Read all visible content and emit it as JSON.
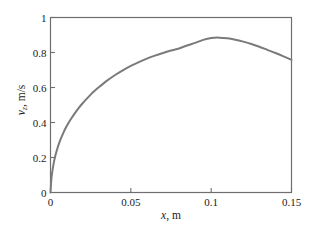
{
  "figure": {
    "background_color": "#ffffff",
    "axis_color": "#6e6e6e",
    "curve_color": "#7a7a7a",
    "text_color": "#1a1a1a"
  },
  "axis_titles": {
    "x_symbol": "x",
    "x_unit": ", m",
    "y_symbol": "v",
    "y_subscript": "z",
    "y_unit": ", m/s"
  },
  "chart_data": {
    "type": "line",
    "title": "",
    "xlabel": "x, m",
    "ylabel": "v_z, m/s",
    "xlim": [
      0,
      0.15
    ],
    "ylim": [
      0,
      1
    ],
    "xticks": [
      0,
      0.05,
      0.1,
      0.15
    ],
    "xtick_labels": [
      "0",
      "0.05",
      "0.1",
      "0.15"
    ],
    "yticks": [
      0,
      0.2,
      0.4,
      0.6,
      0.8,
      1
    ],
    "ytick_labels": [
      "0",
      "0.2",
      "0.4",
      "0.6",
      "0.8",
      "1"
    ],
    "grid": false,
    "legend": null,
    "series": [
      {
        "name": "v_z",
        "color": "#7a7a7a",
        "linewidth": 2,
        "x": [
          0,
          0.0005,
          0.001,
          0.002,
          0.003,
          0.004,
          0.005,
          0.006,
          0.008,
          0.01,
          0.0125,
          0.015,
          0.0175,
          0.02,
          0.0225,
          0.025,
          0.0275,
          0.03,
          0.035,
          0.04,
          0.045,
          0.05,
          0.055,
          0.06,
          0.065,
          0.07,
          0.075,
          0.08,
          0.085,
          0.09,
          0.095,
          0.1,
          0.105,
          0.11,
          0.115,
          0.12,
          0.125,
          0.13,
          0.135,
          0.14,
          0.145,
          0.15
        ],
        "y": [
          0,
          0.071,
          0.112,
          0.168,
          0.21,
          0.243,
          0.272,
          0.298,
          0.341,
          0.378,
          0.417,
          0.451,
          0.482,
          0.51,
          0.535,
          0.559,
          0.581,
          0.601,
          0.638,
          0.67,
          0.698,
          0.723,
          0.745,
          0.765,
          0.782,
          0.797,
          0.811,
          0.823,
          0.84,
          0.855,
          0.872,
          0.883,
          0.885,
          0.881,
          0.873,
          0.862,
          0.849,
          0.833,
          0.815,
          0.797,
          0.778,
          0.758
        ]
      }
    ],
    "annotations": {
      "peak_x": 0.105,
      "peak_y": 0.885,
      "endpoint_x": 0.15,
      "endpoint_y": 0.758,
      "origin_y": 0
    }
  }
}
